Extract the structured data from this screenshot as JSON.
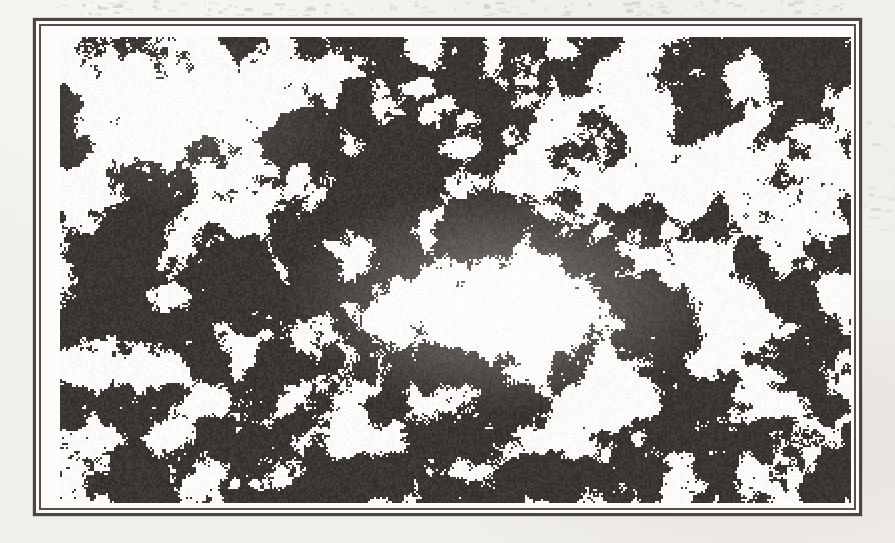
{
  "figure": {
    "kind": "scanned-figure",
    "caption": "",
    "label": "",
    "has_caption": false,
    "has_axis_labels": false,
    "has_legend": false,
    "has_text": false
  },
  "page": {
    "width": 895,
    "height": 543,
    "paper_color": "#f1efeb",
    "background_color": "#ffffff"
  },
  "frame": {
    "left": 33,
    "top": 18,
    "width": 829,
    "height": 498,
    "outer_rule_color": "#4a4641",
    "outer_rule_width": 3,
    "inner_rule_color": "#55504a",
    "inner_rule_width": 2,
    "fill_color": "#fdfcfa"
  },
  "plate": {
    "left": 19,
    "top": 11,
    "width": 791,
    "height": 466,
    "ink_color": "#3a3632",
    "paper_color": "#fbfaf8",
    "dark_coverage_percent": 55,
    "render": {
      "cell_size": 2,
      "noise_octaves": [
        {
          "scale": 0.055,
          "weight": 1.0
        },
        {
          "scale": 0.125,
          "weight": 0.55
        },
        {
          "scale": 0.27,
          "weight": 0.3
        },
        {
          "scale": 0.6,
          "weight": 0.18
        }
      ],
      "threshold": 0.5,
      "seed": 20240917,
      "bright_regions": [
        {
          "cx": 0.56,
          "cy": 0.57,
          "rx": 0.17,
          "ry": 0.15,
          "strength": 0.42
        },
        {
          "cx": 0.83,
          "cy": 0.3,
          "rx": 0.11,
          "ry": 0.12,
          "strength": 0.3
        },
        {
          "cx": 0.14,
          "cy": 0.17,
          "rx": 0.09,
          "ry": 0.1,
          "strength": 0.2
        },
        {
          "cx": 0.3,
          "cy": 0.78,
          "rx": 0.08,
          "ry": 0.09,
          "strength": 0.16
        },
        {
          "cx": 0.72,
          "cy": 0.76,
          "rx": 0.09,
          "ry": 0.08,
          "strength": 0.18
        }
      ],
      "dark_regions": [
        {
          "cx": 0.44,
          "cy": 0.3,
          "rx": 0.16,
          "ry": 0.14,
          "strength": 0.26
        },
        {
          "cx": 0.07,
          "cy": 0.5,
          "rx": 0.09,
          "ry": 0.22,
          "strength": 0.22
        },
        {
          "cx": 0.5,
          "cy": 0.94,
          "rx": 0.3,
          "ry": 0.08,
          "strength": 0.2
        },
        {
          "cx": 0.95,
          "cy": 0.62,
          "rx": 0.08,
          "ry": 0.16,
          "strength": 0.18
        }
      ]
    }
  },
  "artifacts": {
    "top_bleed_opacity": 0.2,
    "right_bleed_opacity": 0.16
  }
}
